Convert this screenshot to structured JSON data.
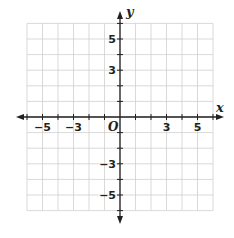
{
  "graph": {
    "type": "coordinate-plane",
    "x_axis_label": "x",
    "y_axis_label": "y",
    "origin_label": "O",
    "x_range": [
      -6,
      6
    ],
    "y_range": [
      -6,
      6
    ],
    "grid_step": 1,
    "x_tick_labels": [
      {
        "value": -5,
        "text": "−5"
      },
      {
        "value": -3,
        "text": "−3"
      },
      {
        "value": 3,
        "text": "3"
      },
      {
        "value": 5,
        "text": "5"
      }
    ],
    "y_tick_labels": [
      {
        "value": 5,
        "text": "5"
      },
      {
        "value": 3,
        "text": "3"
      },
      {
        "value": -3,
        "text": "−3"
      },
      {
        "value": -5,
        "text": "−5"
      }
    ],
    "colors": {
      "grid": "#cfcfcf",
      "axis": "#231f20",
      "background": "#ffffff"
    }
  }
}
